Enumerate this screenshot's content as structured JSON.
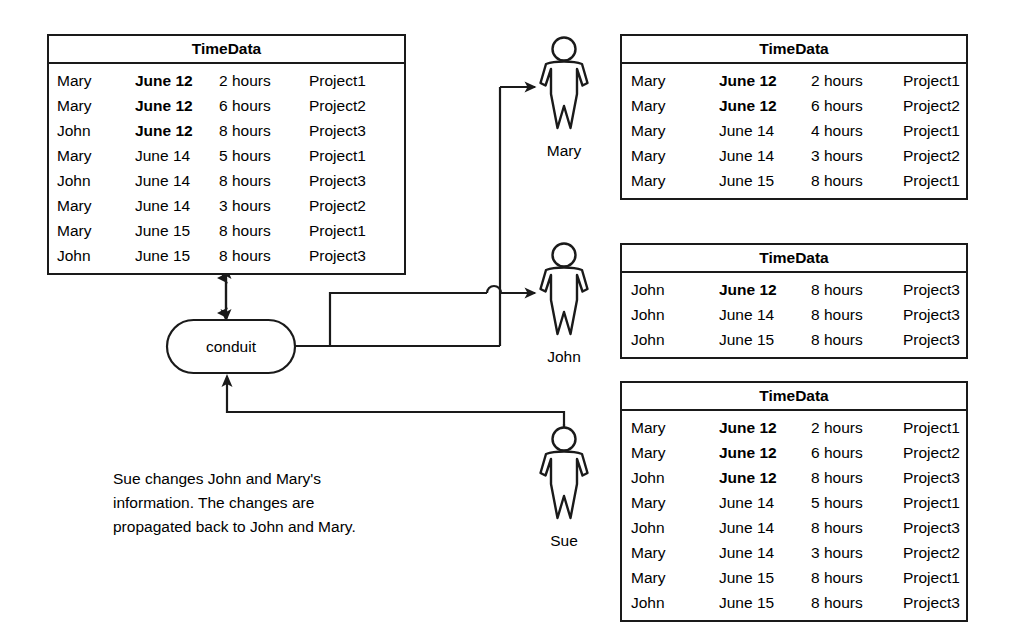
{
  "diagram": {
    "caption": "Sue changes John and Mary's\ninformation.  The changes are\npropagated back to John and Mary.",
    "conduit_label": "conduit",
    "colors": {
      "stroke": "#1a1a1a",
      "background": "#ffffff",
      "text": "#000000"
    }
  },
  "tables": {
    "main": {
      "title": "TimeData",
      "rows": [
        {
          "name": "Mary",
          "date": "June 12",
          "hours": "2 hours",
          "project": "Project1",
          "date_bold": true
        },
        {
          "name": "Mary",
          "date": "June 12",
          "hours": "6 hours",
          "project": "Project2",
          "date_bold": true
        },
        {
          "name": "John",
          "date": "June 12",
          "hours": "8 hours",
          "project": "Project3",
          "date_bold": true
        },
        {
          "name": "Mary",
          "date": "June 14",
          "hours": "5 hours",
          "project": "Project1",
          "date_bold": false
        },
        {
          "name": "John",
          "date": "June 14",
          "hours": "8 hours",
          "project": "Project3",
          "date_bold": false
        },
        {
          "name": "Mary",
          "date": "June 14",
          "hours": "3 hours",
          "project": "Project2",
          "date_bold": false
        },
        {
          "name": "Mary",
          "date": "June 15",
          "hours": "8 hours",
          "project": "Project1",
          "date_bold": false
        },
        {
          "name": "John",
          "date": "June 15",
          "hours": "8 hours",
          "project": "Project3",
          "date_bold": false
        }
      ]
    },
    "mary": {
      "title": "TimeData",
      "rows": [
        {
          "name": "Mary",
          "date": "June 12",
          "hours": "2 hours",
          "project": "Project1",
          "date_bold": true
        },
        {
          "name": "Mary",
          "date": "June 12",
          "hours": "6 hours",
          "project": "Project2",
          "date_bold": true
        },
        {
          "name": "Mary",
          "date": "June 14",
          "hours": "4 hours",
          "project": "Project1",
          "date_bold": false
        },
        {
          "name": "Mary",
          "date": "June 14",
          "hours": "3 hours",
          "project": "Project2",
          "date_bold": false
        },
        {
          "name": "Mary",
          "date": "June 15",
          "hours": "8 hours",
          "project": "Project1",
          "date_bold": false
        }
      ]
    },
    "john": {
      "title": "TimeData",
      "rows": [
        {
          "name": "John",
          "date": "June 12",
          "hours": "8 hours",
          "project": "Project3",
          "date_bold": true
        },
        {
          "name": "John",
          "date": "June 14",
          "hours": "8 hours",
          "project": "Project3",
          "date_bold": false
        },
        {
          "name": "John",
          "date": "June 15",
          "hours": "8 hours",
          "project": "Project3",
          "date_bold": false
        }
      ]
    },
    "sue": {
      "title": "TimeData",
      "rows": [
        {
          "name": "Mary",
          "date": "June 12",
          "hours": "2 hours",
          "project": "Project1",
          "date_bold": true
        },
        {
          "name": "Mary",
          "date": "June 12",
          "hours": "6 hours",
          "project": "Project2",
          "date_bold": true
        },
        {
          "name": "John",
          "date": "June 12",
          "hours": "8 hours",
          "project": "Project3",
          "date_bold": true
        },
        {
          "name": "Mary",
          "date": "June 14",
          "hours": "5 hours",
          "project": "Project1",
          "date_bold": false
        },
        {
          "name": "John",
          "date": "June 14",
          "hours": "8 hours",
          "project": "Project3",
          "date_bold": false
        },
        {
          "name": "Mary",
          "date": "June 14",
          "hours": "3 hours",
          "project": "Project2",
          "date_bold": false
        },
        {
          "name": "Mary",
          "date": "June 15",
          "hours": "8 hours",
          "project": "Project1",
          "date_bold": false
        },
        {
          "name": "John",
          "date": "June 15",
          "hours": "8 hours",
          "project": "Project3",
          "date_bold": false
        }
      ]
    }
  },
  "people": [
    {
      "key": "mary",
      "label": "Mary"
    },
    {
      "key": "john",
      "label": "John"
    },
    {
      "key": "sue",
      "label": "Sue"
    }
  ]
}
